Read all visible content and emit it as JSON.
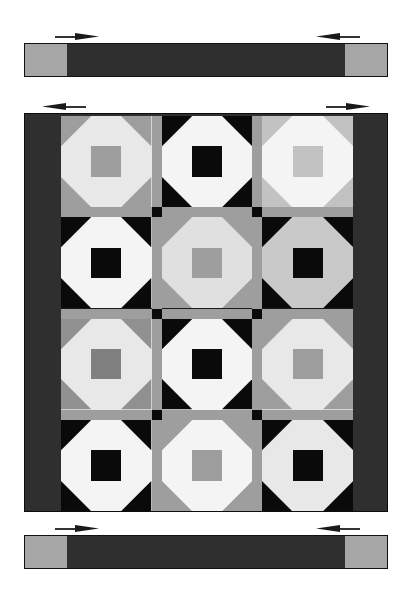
{
  "document": {
    "title": "Quilt Assembly Diagram",
    "type": "quilt-construction-illustration",
    "background_color": "#ffffff"
  },
  "palette": {
    "dark": "#2f2f2f",
    "black": "#0a0a0a",
    "medium_gray": "#9e9e9e",
    "light_gray": "#c9c9c9",
    "pale": "#e8e8e8",
    "white": "#f4f4f4",
    "outline": "#1a1a1a"
  },
  "top_border_strip": {
    "name": "top-border-strip",
    "left_cap_color": "#a6a6a6",
    "middle_color": "#2f2f2f",
    "right_cap_color": "#a6a6a6",
    "arrows": [
      {
        "name": "top-strip-arrow-left",
        "direction": "right"
      },
      {
        "name": "top-strip-arrow-right",
        "direction": "left"
      }
    ]
  },
  "bottom_border_strip": {
    "name": "bottom-border-strip",
    "left_cap_color": "#a6a6a6",
    "middle_color": "#2f2f2f",
    "right_cap_color": "#a6a6a6",
    "arrows": [
      {
        "name": "bottom-strip-arrow-left",
        "direction": "right"
      },
      {
        "name": "bottom-strip-arrow-right",
        "direction": "left"
      }
    ]
  },
  "quilt_panel": {
    "name": "quilt-center-panel",
    "border_color": "#2f2f2f",
    "sashing_color": "#9e9e9e",
    "cornerstone_color": "#0a0a0a",
    "rows": 4,
    "columns": 3,
    "arrows": [
      {
        "name": "panel-arrow-left",
        "direction": "left"
      },
      {
        "name": "panel-arrow-right",
        "direction": "right"
      }
    ]
  },
  "chart_data": {
    "type": "table",
    "xlabel": "column",
    "ylabel": "row",
    "categories": [
      "col 1",
      "col 2",
      "col 3"
    ],
    "blocks": [
      [
        {
          "id": "r1c1",
          "pattern": "shoofly",
          "triangle": "#9e9e9e",
          "center": "#9e9e9e",
          "background": "#e8e8e8"
        },
        {
          "id": "r1c2",
          "pattern": "shoofly",
          "triangle": "#0a0a0a",
          "center": "#0a0a0a",
          "background": "#f4f4f4"
        },
        {
          "id": "r1c3",
          "pattern": "shoofly",
          "triangle": "#c2c2c2",
          "center": "#c2c2c2",
          "background": "#f4f4f4"
        }
      ],
      [
        {
          "id": "r2c1",
          "pattern": "shoofly",
          "triangle": "#0a0a0a",
          "center": "#0a0a0a",
          "background": "#f4f4f4"
        },
        {
          "id": "r2c2",
          "pattern": "shoofly",
          "triangle": "#9e9e9e",
          "center": "#9e9e9e",
          "background": "#e0e0e0"
        },
        {
          "id": "r2c3",
          "pattern": "shoofly",
          "triangle": "#0a0a0a",
          "center": "#0a0a0a",
          "background": "#c9c9c9"
        }
      ],
      [
        {
          "id": "r3c1",
          "pattern": "shoofly",
          "triangle": "#909090",
          "center": "#808080",
          "background": "#e8e8e8"
        },
        {
          "id": "r3c2",
          "pattern": "shoofly",
          "triangle": "#0a0a0a",
          "center": "#0a0a0a",
          "background": "#f4f4f4"
        },
        {
          "id": "r3c3",
          "pattern": "shoofly",
          "triangle": "#9e9e9e",
          "center": "#9e9e9e",
          "background": "#e8e8e8"
        }
      ],
      [
        {
          "id": "r4c1",
          "pattern": "shoofly",
          "triangle": "#0a0a0a",
          "center": "#0a0a0a",
          "background": "#f4f4f4"
        },
        {
          "id": "r4c2",
          "pattern": "shoofly",
          "triangle": "#9e9e9e",
          "center": "#9e9e9e",
          "background": "#f4f4f4"
        },
        {
          "id": "r4c3",
          "pattern": "shoofly",
          "triangle": "#0a0a0a",
          "center": "#0a0a0a",
          "background": "#e8e8e8"
        }
      ]
    ]
  }
}
